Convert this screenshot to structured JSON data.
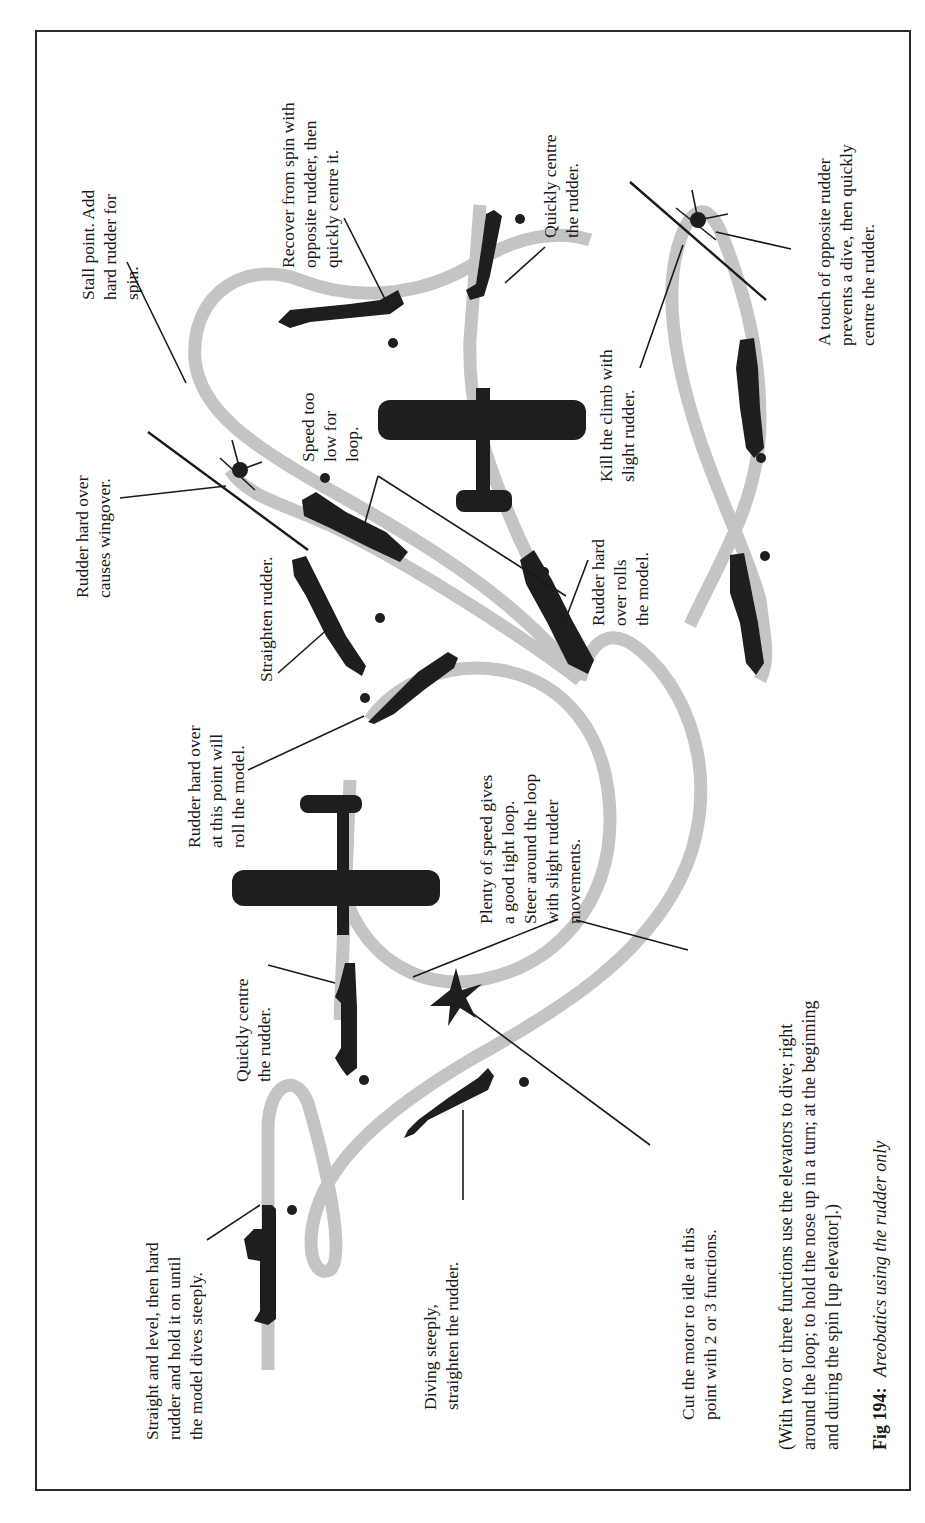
{
  "figure": {
    "number_label": "Fig 194:",
    "caption": "Areobatics using the rudder only",
    "note_lines": [
      "(With two or three functions use the elevators to dive; right",
      "around the loop; to hold the nose up in a turn; at the beginning",
      "and during the spin [up elevator].)"
    ]
  },
  "labels": {
    "straight_level": [
      "Straight and level, then hard",
      "rudder and hold it on until",
      "the model dives steeply."
    ],
    "diving_steeply": [
      "Diving steeply,",
      "straighten the rudder."
    ],
    "cut_motor": [
      "Cut the motor to idle at this",
      "point with 2 or 3 functions."
    ],
    "quickly_centre_left": [
      "Quickly centre",
      "the rudder."
    ],
    "rudder_hard_point": [
      "Rudder hard over",
      "at this point will",
      "roll the model."
    ],
    "plenty_speed": [
      "Plenty of speed gives",
      "a good tight loop.",
      "Steer around the loop",
      "with slight rudder",
      "movements."
    ],
    "straighten": [
      "Straighten rudder."
    ],
    "wingover": [
      "Rudder hard over",
      "causes wingover."
    ],
    "speed_low": [
      "Speed too",
      "low for",
      "loop."
    ],
    "rolls_model": [
      "Rudder hard",
      "over rolls",
      "the model."
    ],
    "stall_point": [
      "Stall point. Add",
      "hard rudder for",
      "spin."
    ],
    "recover_spin": [
      "Recover from spin with",
      "opposite rudder, then",
      "quickly centre it."
    ],
    "quickly_centre_right": [
      "Quickly centre",
      "the rudder."
    ],
    "kill_climb": [
      "Kill the climb with",
      "slight rudder."
    ],
    "touch_opposite": [
      "A touch of opposite rudder",
      "prevents a dive, then quickly",
      "centre the rudder."
    ]
  },
  "colors": {
    "flight_path": "#c4c4c4",
    "silhouette": "#1e1e1e",
    "frame": "#2a2a2a",
    "text": "#1a1a1a"
  }
}
